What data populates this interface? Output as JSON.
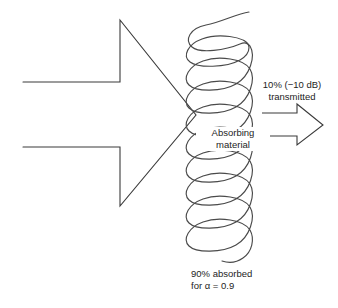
{
  "figure": {
    "background_color": "#ffffff",
    "line_color": "#3a3a3a",
    "text_color": "#1d1d1d",
    "width": 338,
    "height": 308
  },
  "incident": {
    "name": "incident-sound-arrow",
    "description": "large open outline arrow pointing right into the absorbing material"
  },
  "material": {
    "label_line1": "Absorbing",
    "label_line2": "material",
    "name": "absorbing-material-squiggle",
    "description": "vertical serpentine looped squiggle column representing absorbing material"
  },
  "transmitted": {
    "label_line1": "10% (−10 dB)",
    "label_line2": "transmitted",
    "arrow_name": "transmitted-sound-arrow"
  },
  "absorbed": {
    "label_line1": "90% absorbed",
    "label_line2": "for α = 0.9"
  }
}
